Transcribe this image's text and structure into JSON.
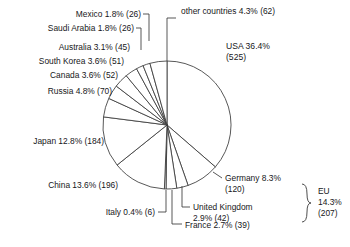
{
  "chart_data": {
    "type": "pie",
    "title": "",
    "subtitle": "",
    "xlabel": "",
    "ylabel": "",
    "legend_position": "callout-labels",
    "grid": false,
    "start_angle_deg": 0,
    "direction": "clockwise",
    "units": "count",
    "categories": [
      "USA",
      "Germany",
      "United Kingdom",
      "France",
      "Italy",
      "China",
      "Japan",
      "Russia",
      "Canada",
      "South Korea",
      "Australia",
      "Saudi Arabia",
      "Mexico",
      "other countries"
    ],
    "values": [
      525,
      120,
      42,
      39,
      6,
      196,
      184,
      70,
      52,
      51,
      45,
      26,
      26,
      62
    ],
    "percentages": [
      36.4,
      8.3,
      2.9,
      2.7,
      0.4,
      13.6,
      12.8,
      4.8,
      3.6,
      3.6,
      3.1,
      1.8,
      1.8,
      4.3
    ],
    "slices": [
      {
        "name": "USA",
        "percent": 36.4,
        "value": 525,
        "label": "USA 36.4%",
        "value_label": "(525)"
      },
      {
        "name": "Germany",
        "percent": 8.3,
        "value": 120,
        "label": "Germany 8.3%",
        "value_label": "(120)"
      },
      {
        "name": "United Kingdom",
        "percent": 2.9,
        "value": 42,
        "label": "United Kingdom",
        "value_label": "2.9% (42)"
      },
      {
        "name": "France",
        "percent": 2.7,
        "value": 39,
        "label": "France 2.7% (39)",
        "value_label": ""
      },
      {
        "name": "Italy",
        "percent": 0.4,
        "value": 6,
        "label": "Italy 0.4% (6)",
        "value_label": ""
      },
      {
        "name": "China",
        "percent": 13.6,
        "value": 196,
        "label": "China 13.6% (196)",
        "value_label": ""
      },
      {
        "name": "Japan",
        "percent": 12.8,
        "value": 184,
        "label": "Japan 12.8% (184)",
        "value_label": ""
      },
      {
        "name": "Russia",
        "percent": 4.8,
        "value": 70,
        "label": "Russia 4.8% (70)",
        "value_label": ""
      },
      {
        "name": "Canada",
        "percent": 3.6,
        "value": 52,
        "label": "Canada 3.6% (52)",
        "value_label": ""
      },
      {
        "name": "South Korea",
        "percent": 3.6,
        "value": 51,
        "label": "South Korea 3.6% (51)",
        "value_label": ""
      },
      {
        "name": "Australia",
        "percent": 3.1,
        "value": 45,
        "label": "Australia 3.1% (45)",
        "value_label": ""
      },
      {
        "name": "Saudi Arabia",
        "percent": 1.8,
        "value": 26,
        "label": "Saudi Arabia 1.8% (26)",
        "value_label": ""
      },
      {
        "name": "Mexico",
        "percent": 1.8,
        "value": 26,
        "label": "Mexico 1.8% (26)",
        "value_label": ""
      },
      {
        "name": "other countries",
        "percent": 4.3,
        "value": 62,
        "label": "other countries 4.3% (62)",
        "value_label": ""
      }
    ],
    "annotations": [
      {
        "name": "eu-group",
        "label_line1": "EU",
        "label_line2": "14.3%",
        "label_line3": "(207)",
        "members": [
          "Germany",
          "United Kingdom",
          "France"
        ],
        "percent": 14.3,
        "value": 207
      }
    ],
    "colors": {
      "slice_fill": "#ffffff",
      "slice_stroke": "#3a3a3a",
      "text": "#17171a",
      "leader": "#3a3a3a"
    }
  }
}
